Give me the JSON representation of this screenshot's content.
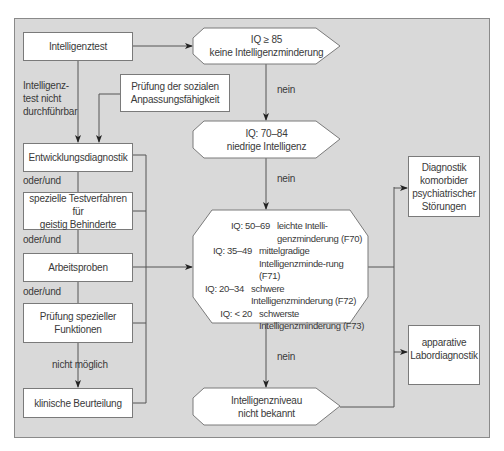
{
  "diagram": {
    "nodes": {
      "intelligence_test": "Intelligenztest",
      "iq_85": {
        "line1": "IQ ≥ 85",
        "line2": "keine Intelligenzminderung"
      },
      "social_adaptation": {
        "line1": "Prüfung der sozialen",
        "line2": "Anpassungsfähigkeit"
      },
      "iq_70_84": {
        "line1": "IQ: 70–84",
        "line2": "niedrige Intelligenz"
      },
      "development_diagnostics": "Entwicklungsdiagnostik",
      "special_tests": {
        "line1": "spezielle Testverfahren für",
        "line2": "geistig Behinderte"
      },
      "work_samples": "Arbeitsproben",
      "special_functions": {
        "line1": "Prüfung spezieller",
        "line2": "Funktionen"
      },
      "clinical_assessment": "klinische Beurteilung",
      "intellectual_disability_levels": [
        {
          "iq": "IQ: 50–69",
          "desc": "leichte Intelli-genzminderung (F70)"
        },
        {
          "iq": "IQ: 35–49",
          "desc": "mittelgradige Intelligenzminde-rung (F71)"
        },
        {
          "iq": "IQ: 20–34",
          "desc": "schwere Intelligenzminderung (F72)"
        },
        {
          "iq": "IQ: < 20",
          "desc": "schwerste Intelligenzminderung (F73)"
        }
      ],
      "level_unknown": {
        "line1": "Intelligenzniveau",
        "line2": "nicht bekannt"
      },
      "comorbid_diagnostics": {
        "line1": "Diagnostik",
        "line2": "komorbider",
        "line3": "psychiatrischer",
        "line4": "Störungen"
      },
      "lab_diagnostics": {
        "line1": "apparative",
        "line2": "Labordiagnostik"
      }
    },
    "edge_labels": {
      "test_not_possible": {
        "line1": "Intelligenz-",
        "line2": "test nicht",
        "line3": "durchführbar"
      },
      "no_1": "nein",
      "no_2": "nein",
      "no_3": "nein",
      "or_and_1": "oder/und",
      "or_and_2": "oder/und",
      "or_and_3": "oder/und",
      "not_possible": "nicht möglich"
    },
    "colors": {
      "panel_bg": "#d9d9d9",
      "box_bg": "#ffffff",
      "line": "#555555"
    }
  }
}
